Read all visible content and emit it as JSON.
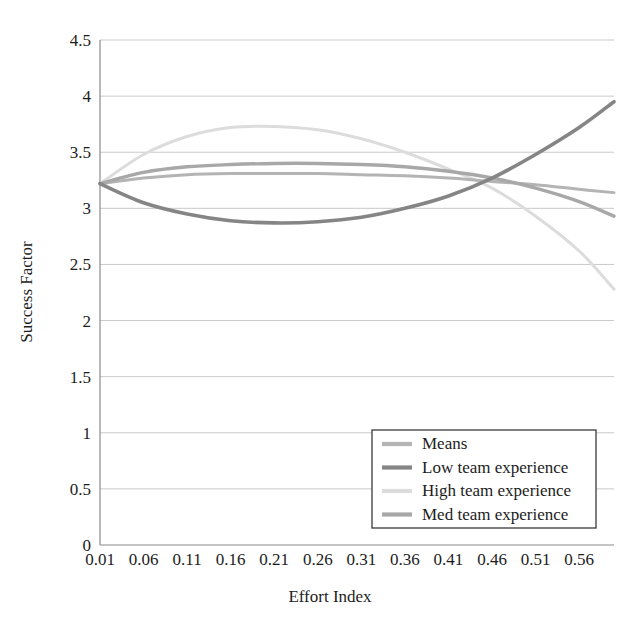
{
  "chart_data": {
    "type": "line",
    "title": "",
    "xlabel": "Effort Index",
    "ylabel": "Success Factor",
    "xlim": [
      0.01,
      0.6
    ],
    "ylim": [
      0,
      4.5
    ],
    "grid": true,
    "legend_position": "bottom-right",
    "xticks": [
      "0.01",
      "0.06",
      "0.11",
      "0.16",
      "0.21",
      "0.26",
      "0.31",
      "0.36",
      "0.41",
      "0.46",
      "0.51",
      "0.56"
    ],
    "xtick_values": [
      0.01,
      0.06,
      0.11,
      0.16,
      0.21,
      0.26,
      0.31,
      0.36,
      0.41,
      0.46,
      0.51,
      0.56
    ],
    "yticks": [
      "0",
      "0.5",
      "1",
      "1.5",
      "2",
      "2.5",
      "3",
      "3.5",
      "4",
      "4.5"
    ],
    "ytick_values": [
      0,
      0.5,
      1,
      1.5,
      2,
      2.5,
      3,
      3.5,
      4,
      4.5
    ],
    "x": [
      0.01,
      0.06,
      0.11,
      0.16,
      0.21,
      0.26,
      0.31,
      0.36,
      0.41,
      0.46,
      0.51,
      0.56,
      0.6
    ],
    "series": [
      {
        "name": "Means",
        "color": "#b4b4b4",
        "width": 3.0,
        "values": [
          3.22,
          3.27,
          3.3,
          3.31,
          3.31,
          3.31,
          3.3,
          3.29,
          3.27,
          3.24,
          3.21,
          3.17,
          3.14
        ]
      },
      {
        "name": "Low team experience",
        "color": "#858585",
        "width": 3.6,
        "values": [
          3.22,
          3.05,
          2.95,
          2.89,
          2.87,
          2.88,
          2.92,
          3.0,
          3.11,
          3.27,
          3.48,
          3.72,
          3.95
        ]
      },
      {
        "name": "High team experience",
        "color": "#dcdcdc",
        "width": 3.0,
        "values": [
          3.22,
          3.48,
          3.64,
          3.72,
          3.73,
          3.7,
          3.62,
          3.5,
          3.35,
          3.18,
          2.93,
          2.62,
          2.28
        ]
      },
      {
        "name": "Med team experience",
        "color": "#a8a8a8",
        "width": 3.4,
        "values": [
          3.22,
          3.32,
          3.37,
          3.39,
          3.4,
          3.4,
          3.39,
          3.37,
          3.33,
          3.27,
          3.18,
          3.06,
          2.93
        ]
      }
    ]
  },
  "legend": {
    "items": [
      {
        "label": "Means",
        "color": "#b4b4b4"
      },
      {
        "label": "Low team experience",
        "color": "#858585"
      },
      {
        "label": "High team experience",
        "color": "#dcdcdc"
      },
      {
        "label": "Med team experience",
        "color": "#a8a8a8"
      }
    ]
  },
  "axes": {
    "x_title": "Effort Index",
    "y_title": "Success Factor"
  }
}
